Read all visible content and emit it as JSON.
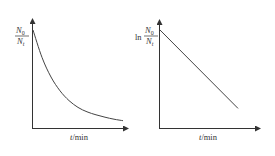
{
  "chart_data": [
    {
      "type": "line",
      "title": "",
      "ylabel": "N0/Nt",
      "ylabel_parts": {
        "prefix": "",
        "numerator": "N",
        "numerator_sub": "0",
        "denominator": "N",
        "denominator_sub": "t"
      },
      "xlabel": "t/min",
      "xlabel_parts": {
        "var": "t",
        "unit": "/min"
      },
      "grid": false,
      "legend": null,
      "ticks": "none",
      "curve": "exponential decay (decreasing, convex)",
      "x": [
        0,
        0.1,
        0.2,
        0.3,
        0.4,
        0.5,
        0.6,
        0.7,
        0.8,
        0.9,
        1.0
      ],
      "values": [
        1.0,
        0.72,
        0.52,
        0.38,
        0.28,
        0.21,
        0.165,
        0.135,
        0.11,
        0.09,
        0.075
      ]
    },
    {
      "type": "line",
      "title": "",
      "ylabel": "ln N0/Nt",
      "ylabel_parts": {
        "prefix": "ln",
        "numerator": "N",
        "numerator_sub": "0",
        "denominator": "N",
        "denominator_sub": "t"
      },
      "xlabel": "t/min",
      "xlabel_parts": {
        "var": "t",
        "unit": "/min"
      },
      "grid": false,
      "legend": null,
      "ticks": "none",
      "curve": "straight line, negative slope",
      "x": [
        0,
        1.0
      ],
      "values": [
        1.0,
        0.2
      ]
    }
  ],
  "colors": {
    "axis": "#333333",
    "line": "#444444"
  }
}
